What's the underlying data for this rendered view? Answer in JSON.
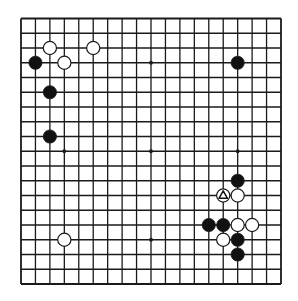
{
  "board": {
    "size": 19,
    "colors": {
      "background": "#ffffff",
      "line": "#1a1a1a",
      "black_stone": "#111111",
      "white_stone": "#ffffff",
      "stone_outline": "#1a1a1a",
      "marker": "#111111"
    },
    "star_points": [
      [
        3,
        3
      ],
      [
        9,
        3
      ],
      [
        15,
        3
      ],
      [
        3,
        9
      ],
      [
        9,
        9
      ],
      [
        15,
        9
      ],
      [
        3,
        15
      ],
      [
        9,
        15
      ],
      [
        15,
        15
      ]
    ],
    "stones": [
      {
        "color": "white",
        "col": 2,
        "row": 2
      },
      {
        "color": "white",
        "col": 5,
        "row": 2
      },
      {
        "color": "black",
        "col": 1,
        "row": 3
      },
      {
        "color": "white",
        "col": 3,
        "row": 3
      },
      {
        "color": "black",
        "col": 2,
        "row": 5
      },
      {
        "color": "black",
        "col": 2,
        "row": 8
      },
      {
        "color": "black",
        "col": 15,
        "row": 3
      },
      {
        "color": "white",
        "col": 3,
        "row": 15
      },
      {
        "color": "black",
        "col": 15,
        "row": 11
      },
      {
        "color": "white",
        "col": 14,
        "row": 12,
        "marker": "triangle"
      },
      {
        "color": "white",
        "col": 15,
        "row": 12
      },
      {
        "color": "black",
        "col": 13,
        "row": 14
      },
      {
        "color": "black",
        "col": 14,
        "row": 14
      },
      {
        "color": "white",
        "col": 15,
        "row": 14
      },
      {
        "color": "white",
        "col": 16,
        "row": 14
      },
      {
        "color": "white",
        "col": 14,
        "row": 15
      },
      {
        "color": "black",
        "col": 15,
        "row": 15
      },
      {
        "color": "black",
        "col": 15,
        "row": 16
      }
    ],
    "markers": [
      {
        "type": "triangle",
        "col": 14,
        "row": 12,
        "icon": "triangle-marker-icon"
      }
    ]
  }
}
